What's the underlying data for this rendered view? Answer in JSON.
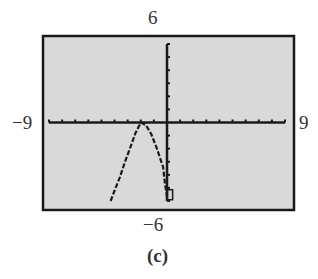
{
  "chart_data": {
    "type": "line",
    "title": "",
    "caption": "(c)",
    "xlabel": "",
    "ylabel": "",
    "xlim": [
      -9,
      9
    ],
    "ylim": [
      -6,
      6
    ],
    "xscale_ticks": 1,
    "yscale_ticks": 1,
    "grid": false,
    "window_labels": {
      "xmin": "−9",
      "xmax": "9",
      "ymin": "−6",
      "ymax": "6"
    },
    "series": [
      {
        "name": "graph",
        "style": "calculator-pixel",
        "x": [
          -4.3,
          -4.0,
          -3.6,
          -3.2,
          -2.8,
          -2.4,
          -2.0,
          -1.6,
          -1.2,
          -0.8,
          -0.5,
          -0.3,
          -0.15,
          0.05
        ],
        "y": [
          -6.0,
          -5.2,
          -4.2,
          -3.0,
          -1.9,
          -0.8,
          0.0,
          -0.2,
          -0.9,
          -1.9,
          -2.8,
          -3.4,
          -4.7,
          -6.0
        ]
      }
    ],
    "cursor": {
      "x": 0.2,
      "y": -5.6,
      "shape": "box"
    },
    "colors": {
      "screen": "#d9d9d9",
      "frame": "#1a1a1a",
      "ink": "#1a1a1a"
    }
  }
}
